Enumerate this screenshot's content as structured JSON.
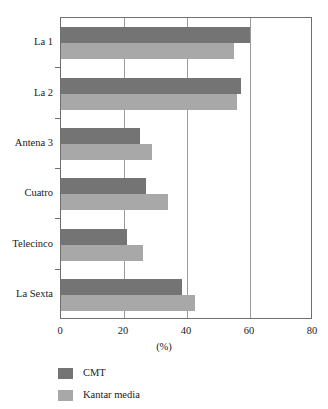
{
  "chart_data": {
    "type": "bar",
    "orientation": "horizontal",
    "title": "",
    "xlabel": "(%)",
    "ylabel": "",
    "xlim": [
      0,
      80
    ],
    "xticks": [
      0,
      20,
      40,
      60,
      80
    ],
    "xtick_labels": [
      "0",
      "20",
      "40",
      "60",
      "80"
    ],
    "grid": true,
    "grid_axis": "x",
    "legend_position": "below-left",
    "categories": [
      "La 1",
      "La 2",
      "Antena 3",
      "Cuatro",
      "Telecinco",
      "La Sexta"
    ],
    "series": [
      {
        "name": "CMT",
        "color": "#747474",
        "values": [
          60,
          57,
          25,
          27,
          21,
          38.5
        ]
      },
      {
        "name": "Kantar media",
        "color": "#a8a8a8",
        "values": [
          55,
          56,
          29,
          34,
          26,
          42.5
        ]
      }
    ]
  },
  "axes": {
    "x_title": "(%)",
    "x_tick_labels": [
      "0",
      "20",
      "40",
      "60",
      "80"
    ],
    "y_tick_labels": [
      "La 1",
      "La 2",
      "Antena 3",
      "Cuatro",
      "Telecinco",
      "La Sexta"
    ]
  },
  "legend": {
    "items": [
      {
        "label": "CMT",
        "color": "#747474"
      },
      {
        "label": "Kantar media",
        "color": "#a8a8a8"
      }
    ]
  },
  "colors": {
    "series_cmt": "#747474",
    "series_kantar": "#a8a8a8",
    "frame": "#6f6f6f",
    "gridline": "#9a9a9a",
    "background": "#ffffff",
    "text": "#1a1a1a"
  }
}
